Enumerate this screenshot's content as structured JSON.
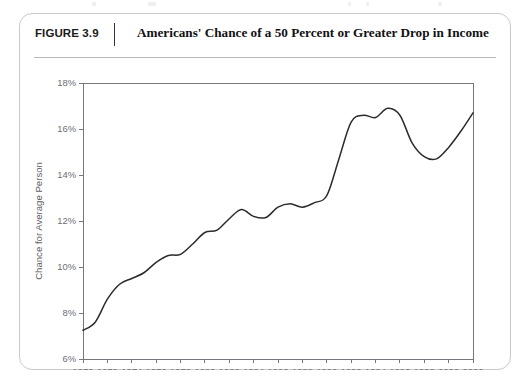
{
  "figure": {
    "number_label": "FIGURE 3.9",
    "title": "Americans' Chance of a 50 Percent or Greater Drop in Income",
    "frame_color": "#c9c9cd"
  },
  "chart_data": {
    "type": "line",
    "title": "Americans' Chance of a 50 Percent or Greater Drop in Income",
    "subtitle": "",
    "xlabel": "",
    "ylabel": "Chance for Average Person",
    "xlim": [
      1970,
      2002
    ],
    "ylim": [
      6,
      18
    ],
    "grid": false,
    "legend": null,
    "legend_position": "none",
    "y_tick_labels": [
      "6%",
      "8%",
      "10%",
      "12%",
      "14%",
      "16%",
      "18%"
    ],
    "y_ticks": [
      6,
      8,
      10,
      12,
      14,
      16,
      18
    ],
    "x_tick_labels": [
      "1970",
      "1972",
      "1974",
      "1976",
      "1978",
      "1980",
      "1982",
      "1984",
      "1986",
      "1988",
      "1990",
      "1992",
      "1994",
      "1996",
      "1998",
      "2000",
      "2002"
    ],
    "x_ticks": [
      1970,
      1972,
      1974,
      1976,
      1978,
      1980,
      1982,
      1984,
      1986,
      1988,
      1990,
      1992,
      1994,
      1996,
      1998,
      2000,
      2002
    ],
    "series": [
      {
        "name": "Chance for Average Person",
        "color": "#2b2b30",
        "x": [
          1970,
          1971,
          1972,
          1973,
          1974,
          1975,
          1976,
          1977,
          1978,
          1979,
          1980,
          1981,
          1982,
          1983,
          1984,
          1985,
          1986,
          1987,
          1988,
          1989,
          1990,
          1991,
          1992,
          1993,
          1994,
          1995,
          1996,
          1997,
          1998,
          1999,
          2000,
          2001,
          2002
        ],
        "values": [
          7.25,
          7.6,
          8.6,
          9.25,
          9.5,
          9.75,
          10.2,
          10.5,
          10.55,
          11.0,
          11.5,
          11.6,
          12.1,
          12.5,
          12.2,
          12.15,
          12.6,
          12.75,
          12.6,
          12.8,
          13.1,
          14.7,
          16.3,
          16.6,
          16.5,
          16.9,
          16.6,
          15.4,
          14.8,
          14.7,
          15.2,
          15.9,
          16.7
        ]
      }
    ]
  }
}
